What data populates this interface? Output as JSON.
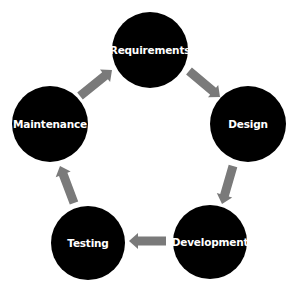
{
  "diagram": {
    "type": "cycle",
    "node_color": "#000000",
    "label_color": "#ffffff",
    "arrow_color": "#7a7a7a",
    "nodes": [
      {
        "id": "requirements",
        "label": "Requirements",
        "cx": 150,
        "cy": 50,
        "r": 38
      },
      {
        "id": "design",
        "label": "Design",
        "cx": 248,
        "cy": 124,
        "r": 38
      },
      {
        "id": "development",
        "label": "Development",
        "cx": 210,
        "cy": 242,
        "r": 37
      },
      {
        "id": "testing",
        "label": "Testing",
        "cx": 88,
        "cy": 243,
        "r": 37
      },
      {
        "id": "maintenance",
        "label": "Maintenance",
        "cx": 50,
        "cy": 124,
        "r": 38
      }
    ],
    "edges": [
      {
        "from": "requirements",
        "to": "design",
        "x1": 189,
        "y1": 71,
        "x2": 220,
        "y2": 97
      },
      {
        "from": "design",
        "to": "development",
        "x1": 233,
        "y1": 166,
        "x2": 222,
        "y2": 204
      },
      {
        "from": "development",
        "to": "testing",
        "x1": 166,
        "y1": 241,
        "x2": 129,
        "y2": 241
      },
      {
        "from": "testing",
        "to": "maintenance",
        "x1": 74,
        "y1": 203,
        "x2": 60,
        "y2": 166
      },
      {
        "from": "maintenance",
        "to": "requirements",
        "x1": 80,
        "y1": 96,
        "x2": 112,
        "y2": 70
      }
    ]
  }
}
